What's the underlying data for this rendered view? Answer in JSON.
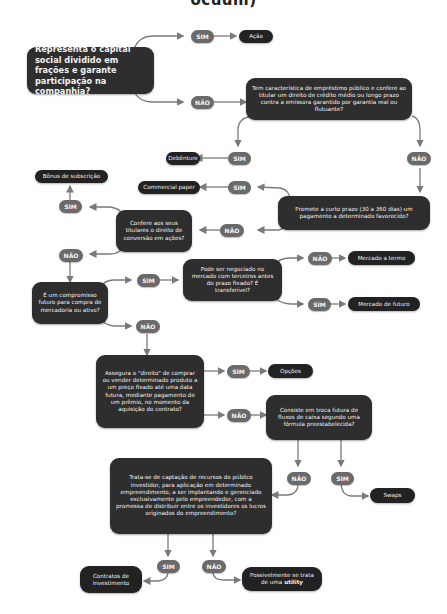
{
  "title_fragment": "ocuum)",
  "labels": {
    "yes": "SIM",
    "no": "NÃO"
  },
  "colors": {
    "node_dark": "#2e2e2e",
    "result_dark": "#222222",
    "pill": "#6a6a6a",
    "connector": "#7a7a7a",
    "background": "#ffffff"
  },
  "questions": {
    "q1": "Representa o capital social dividido em frações e garante participação na companhia?",
    "q2": "Tem característica de empréstimo público e confere ao titular um direito de crédito médio ou longo prazo contra a emissora garantido por garantia real ou flutuante?",
    "q3": "Promete a curto prazo (30 a 360 dias) um pagamento a determinado favorecido?",
    "q4": "Confere aos seus titulares o direito de conversão em ações?",
    "q5": "É um compromisso futuro para compra de mercadoria ou ativo?",
    "q6": "Pode ser negociado no mercado com terceiros antes do prazo fixado? É transferível?",
    "q7": "Assegura o \"direito\" de comprar ou vender determinado produto a um preço fixado até uma data futura, mediante pagamento de um prêmio, no momento da aquisição do contrato?",
    "q8": "Consiste em troca futura de fluxos de caixa segundo uma fórmula preestabelecida?",
    "q9": "Trata-se de captação de recursos do público investidor, para aplicação em determinado empreendimento, a ser implantando e gerenciado exclusivamente pelo empreendedor, com a promessa de distribuir entre os investidores os lucros originados do empreendimento?"
  },
  "results": {
    "acao": "Ação",
    "debenture": "Debênture",
    "commercial_paper": "Commercial paper",
    "bonus": "Bônus de subscrição",
    "termo": "Mercado a termo",
    "futuro": "Mercado de futuro",
    "opcoes": "Opções",
    "swaps": "Swaps",
    "contratos": "Contratos de investimento",
    "utility_prefix": "Possivelmente se trata de uma",
    "utility_bold": "utility"
  }
}
